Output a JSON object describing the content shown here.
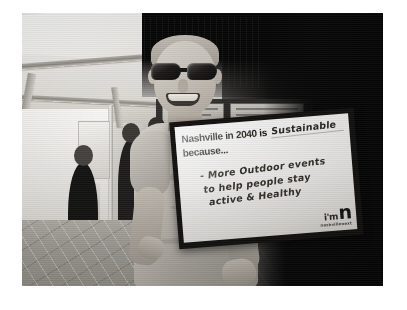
{
  "photo": {
    "alt_description": "Black and white photo of a smiling man wearing dark sunglasses and a grey t-shirt, standing under a white event tent, holding a framed whiteboard sign with a handwritten message.",
    "subject": {
      "name": "man-holding-sign",
      "hair": "short light hair",
      "eyewear": "dark sunglasses",
      "clothing": "grey t-shirt",
      "expression": "smiling"
    },
    "setting": {
      "name": "event-tent",
      "elements": [
        "white tent canopy",
        "metal tent poles",
        "display boards",
        "crowd of people",
        "paver stone ground"
      ]
    }
  },
  "sign": {
    "prompt_prefix": "Nashville in 2040 is",
    "fill_in_answer": "Sustainable",
    "prompt_suffix": "because...",
    "response_lines": [
      "- More Outdoor events",
      "to help people stay",
      "active & Healthy"
    ],
    "logo": {
      "im_text": "i'm",
      "n_text": "n",
      "wordmark": "nashvillenext"
    }
  }
}
